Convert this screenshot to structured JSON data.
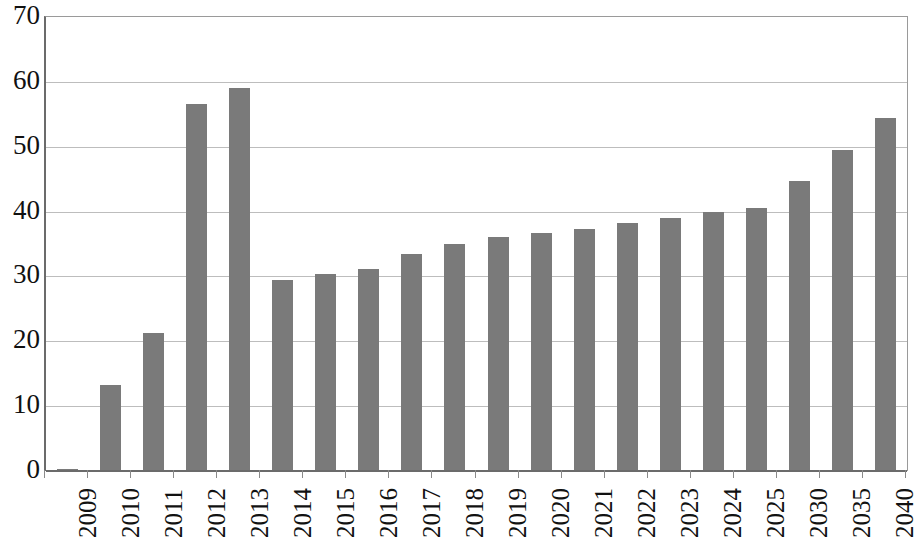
{
  "chart_data": {
    "type": "bar",
    "title": "",
    "subtitle": "",
    "xlabel": "",
    "ylabel": "",
    "categories": [
      "2009",
      "2010",
      "2011",
      "2012",
      "2013",
      "2014",
      "2015",
      "2016",
      "2017",
      "2018",
      "2019",
      "2020",
      "2021",
      "2022",
      "2023",
      "2024",
      "2025",
      "2030",
      "2035",
      "2040"
    ],
    "values": [
      0.3,
      13.3,
      21.3,
      56.6,
      59.0,
      29.5,
      30.3,
      31.1,
      33.5,
      35.0,
      36.1,
      36.7,
      37.3,
      38.2,
      39.0,
      40.0,
      40.6,
      44.7,
      49.5,
      54.4
    ],
    "series": [
      {
        "name": "",
        "values": [
          0.3,
          13.3,
          21.3,
          56.6,
          59.0,
          29.5,
          30.3,
          31.1,
          33.5,
          35.0,
          36.1,
          36.7,
          37.3,
          38.2,
          39.0,
          40.0,
          40.6,
          44.7,
          49.5,
          54.4
        ]
      }
    ],
    "ylim": [
      0,
      70
    ],
    "ytick_labels": [
      "0",
      "10",
      "20",
      "30",
      "40",
      "50",
      "60",
      "70"
    ],
    "ytick_values": [
      0,
      10,
      20,
      30,
      40,
      50,
      60,
      70
    ],
    "grid": true,
    "grid_axis": "y",
    "legend": false,
    "legend_position": "none",
    "bar_color": "#7a7a7a",
    "axis_color": "#6b6b6b",
    "gridline_color": "#bdbdbd",
    "text_color": "#111111",
    "background_color": "#ffffff",
    "xtick_label_rotation": 90
  }
}
